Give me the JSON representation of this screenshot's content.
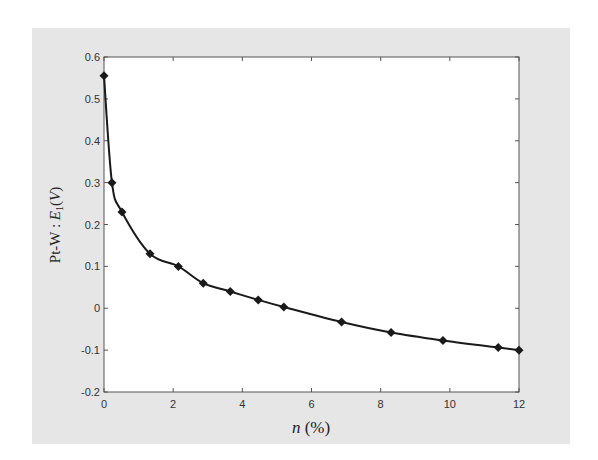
{
  "colors": {
    "figure_background": "#e6e6e6",
    "plot_background": "#ffffff",
    "axes": "#555555",
    "series": "#1a1a1a"
  },
  "chart_data": {
    "type": "line",
    "title": "",
    "xlabel": "n (%)",
    "ylabel": "Pt-W : E1(V)",
    "xlim": [
      0,
      12
    ],
    "ylim": [
      -0.2,
      0.6
    ],
    "xticks": [
      0,
      2,
      4,
      6,
      8,
      10,
      12
    ],
    "yticks": [
      -0.2,
      -0.1,
      0,
      0.1,
      0.2,
      0.3,
      0.4,
      0.5,
      0.6
    ],
    "xtick_labels": [
      "0",
      "2",
      "4",
      "6",
      "8",
      "10",
      "12"
    ],
    "ytick_labels": [
      "-0.2",
      "-0.1",
      "0",
      "0.1",
      "0.2",
      "0.3",
      "0.4",
      "0.5",
      "0.6"
    ],
    "grid": false,
    "legend": null,
    "series": [
      {
        "name": "Pt-W thermoelectric EMF",
        "marker": "diamond",
        "line": "solid",
        "x": [
          0,
          0.23,
          0.52,
          1.33,
          2.15,
          2.87,
          3.65,
          4.46,
          5.2,
          6.87,
          8.3,
          9.8,
          11.4,
          12
        ],
        "y": [
          0.555,
          0.3,
          0.23,
          0.13,
          0.1,
          0.06,
          0.04,
          0.02,
          0.003,
          -0.033,
          -0.058,
          -0.077,
          -0.094,
          -0.1
        ]
      }
    ]
  }
}
